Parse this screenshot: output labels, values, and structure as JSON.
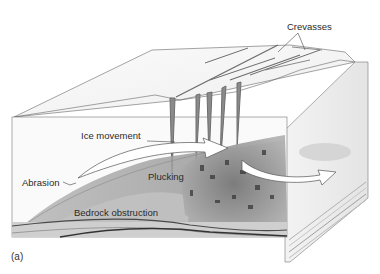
{
  "diagram": {
    "type": "glacier block diagram",
    "labels": {
      "crevasses": "Crevasses",
      "ice_movement": "Ice movement",
      "abrasion": "Abrasion",
      "plucking": "Plucking",
      "bedrock_obstruction": "Bedrock obstruction",
      "panel": "(a)"
    },
    "colors": {
      "ice": "#f7f7f7",
      "ice_shadow": "#dcdcdc",
      "crevasse": "#6e6e6e",
      "bedrock_surface": "#9a9a9a",
      "plucked_rubble": "#6a6a6a",
      "strata_light": "#c9c9c9",
      "strata_mid": "#a9a9a9",
      "strata_dark": "#4a4a4a",
      "arrow_fill": "#ffffff",
      "outline": "#555555"
    }
  }
}
